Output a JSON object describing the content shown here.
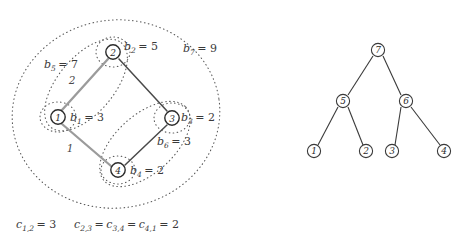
{
  "figure": {
    "title": "",
    "left_panel": {
      "name": "cycle-graph-with-hierarchical-clusters",
      "nodes": [
        {
          "id": "1",
          "label": "1",
          "x": 58,
          "y": 117
        },
        {
          "id": "2",
          "label": "2",
          "x": 113,
          "y": 52
        },
        {
          "id": "3",
          "label": "3",
          "x": 172,
          "y": 118
        },
        {
          "id": "4",
          "label": "4",
          "x": 118,
          "y": 170
        }
      ],
      "edges": [
        {
          "from": "1",
          "to": "2",
          "weight": "2",
          "style": "grey"
        },
        {
          "from": "2",
          "to": "3",
          "weight": "",
          "style": "dark"
        },
        {
          "from": "3",
          "to": "4",
          "weight": "",
          "style": "dark"
        },
        {
          "from": "4",
          "to": "1",
          "weight": "1",
          "style": "grey"
        }
      ],
      "node_labels": [
        {
          "name": "b1-label",
          "base": "b",
          "sub": "1",
          "value": "= 3",
          "x": 70,
          "y": 121
        },
        {
          "name": "b2-label",
          "base": "b",
          "sub": "2",
          "value": "= 5",
          "x": 124,
          "y": 50
        },
        {
          "name": "b3-label",
          "base": "b",
          "sub": "3",
          "value": "= 2",
          "x": 184,
          "y": 121
        },
        {
          "name": "b4-label",
          "base": "b",
          "sub": "4",
          "value": "= 2",
          "x": 130,
          "y": 174
        }
      ],
      "cluster_labels": [
        {
          "name": "b5-label",
          "base": "b",
          "sub": "5",
          "value": "= 7",
          "x": 48,
          "y": 68
        },
        {
          "name": "b6-label",
          "base": "b",
          "sub": "6",
          "value": "= 3",
          "x": 160,
          "y": 144
        },
        {
          "name": "b7-label",
          "base": "b",
          "sub": "7",
          "value": "= 9",
          "x": 185,
          "y": 52
        }
      ],
      "edge_weight_labels": [
        {
          "name": "edge-weight-1-2",
          "text": "2",
          "x": 72,
          "y": 84
        },
        {
          "name": "edge-weight-4-1",
          "text": "1",
          "x": 70,
          "y": 152
        }
      ],
      "caption_left": {
        "name": "cost-c12",
        "base": "c",
        "sub": "1,2",
        "value": "= 3",
        "x": 16,
        "y": 226
      },
      "caption_right": {
        "name": "cost-c23-c34-c41",
        "parts": [
          {
            "base": "c",
            "sub": "2,3"
          },
          {
            "base": "c",
            "sub": "3,4"
          },
          {
            "base": "c",
            "sub": "4,1"
          }
        ],
        "value": "= 2",
        "x": 74,
        "y": 226
      }
    },
    "right_panel": {
      "name": "cluster-hierarchy-tree",
      "nodes": [
        {
          "id": "7",
          "label": "7",
          "x": 378,
          "y": 50,
          "level": 0
        },
        {
          "id": "5",
          "label": "5",
          "x": 343,
          "y": 101,
          "level": 1
        },
        {
          "id": "6",
          "label": "6",
          "x": 406,
          "y": 101,
          "level": 1
        },
        {
          "id": "1",
          "label": "1",
          "x": 314,
          "y": 151,
          "level": 2
        },
        {
          "id": "2",
          "label": "2",
          "x": 366,
          "y": 151,
          "level": 2
        },
        {
          "id": "3",
          "label": "3",
          "x": 392,
          "y": 151,
          "level": 2
        },
        {
          "id": "4",
          "label": "4",
          "x": 444,
          "y": 151,
          "level": 2
        }
      ],
      "edges": [
        {
          "from": "7",
          "to": "5"
        },
        {
          "from": "7",
          "to": "6"
        },
        {
          "from": "5",
          "to": "1"
        },
        {
          "from": "5",
          "to": "2"
        },
        {
          "from": "6",
          "to": "3"
        },
        {
          "from": "6",
          "to": "4"
        }
      ]
    },
    "colors": {
      "node_stroke": "#2b2b2b",
      "edge_grey": "#9b9b9b",
      "edge_dark": "#4a4a4a",
      "dotted": "#5a5a5a",
      "text": "#3a3a3a",
      "background": "#ffffff"
    }
  }
}
